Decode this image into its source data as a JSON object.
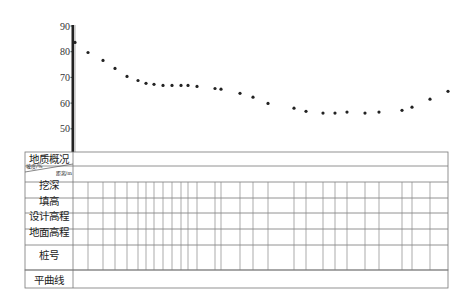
{
  "chart_data": {
    "type": "scatter",
    "title": "",
    "xlabel": "",
    "ylabel": "",
    "ylim": [
      40,
      90
    ],
    "yticks": [
      90,
      80,
      70,
      60,
      50
    ],
    "grid": false,
    "legend": null,
    "points": [
      {
        "x": 75,
        "y": 83.6
      },
      {
        "x": 88,
        "y": 79.7
      },
      {
        "x": 103,
        "y": 76.6
      },
      {
        "x": 115,
        "y": 73.5
      },
      {
        "x": 127,
        "y": 70.4
      },
      {
        "x": 138,
        "y": 68.8
      },
      {
        "x": 146,
        "y": 67.7
      },
      {
        "x": 154,
        "y": 67.3
      },
      {
        "x": 163,
        "y": 66.9
      },
      {
        "x": 172,
        "y": 66.9
      },
      {
        "x": 181,
        "y": 66.9
      },
      {
        "x": 188,
        "y": 66.9
      },
      {
        "x": 197,
        "y": 66.5
      },
      {
        "x": 215,
        "y": 65.7
      },
      {
        "x": 221,
        "y": 65.4
      },
      {
        "x": 240,
        "y": 63.8
      },
      {
        "x": 253,
        "y": 62.3
      },
      {
        "x": 268,
        "y": 59.9
      },
      {
        "x": 294,
        "y": 58.0
      },
      {
        "x": 306,
        "y": 56.8
      },
      {
        "x": 323,
        "y": 56.1
      },
      {
        "x": 335,
        "y": 56.1
      },
      {
        "x": 347,
        "y": 56.5
      },
      {
        "x": 365,
        "y": 56.1
      },
      {
        "x": 379,
        "y": 56.5
      },
      {
        "x": 402,
        "y": 57.2
      },
      {
        "x": 412,
        "y": 58.4
      },
      {
        "x": 430,
        "y": 61.5
      },
      {
        "x": 448,
        "y": 64.6
      }
    ],
    "table": {
      "type": "table",
      "rows": [
        "地质概况",
        "坡度/% 距离/m",
        "挖深",
        "填高",
        "设计高程",
        "地面高程",
        "桩号",
        "平曲线"
      ],
      "cells": "empty"
    }
  },
  "table": {
    "rows": [
      {
        "label": "地质概况"
      },
      {
        "label_top": "坡度/%",
        "label_bottom": "距离/m"
      },
      {
        "label": "挖深"
      },
      {
        "label": "填高"
      },
      {
        "label": "设计高程"
      },
      {
        "label": "地面高程"
      },
      {
        "label": "桩号"
      },
      {
        "label": "平曲线"
      }
    ]
  },
  "axis": {
    "ticks": [
      "90",
      "80",
      "70",
      "60",
      "50"
    ]
  },
  "colors": {
    "line": "#555555",
    "axis": "#222222",
    "dot": "#222222"
  }
}
